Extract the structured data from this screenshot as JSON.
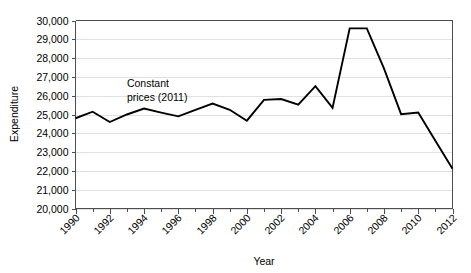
{
  "chart_data": {
    "type": "line",
    "title": "",
    "xlabel": "Year",
    "ylabel": "Expenditure",
    "x": [
      1990,
      1991,
      1992,
      1993,
      1994,
      1995,
      1996,
      1997,
      1998,
      1999,
      2000,
      2001,
      2002,
      2003,
      2004,
      2005,
      2006,
      2007,
      2008,
      2009,
      2010,
      2011,
      2012
    ],
    "values": [
      24800,
      25150,
      24600,
      25000,
      25320,
      25100,
      24900,
      25250,
      25580,
      25250,
      24670,
      25780,
      25820,
      25530,
      26510,
      25350,
      29580,
      29580,
      27450,
      25020,
      25100,
      23600,
      22120
    ],
    "series": [
      {
        "name": "Expenditure (constant prices, 2011)",
        "values": [
          24800,
          25150,
          24600,
          25000,
          25320,
          25100,
          24900,
          25250,
          25580,
          25250,
          24670,
          25780,
          25820,
          25530,
          26510,
          25350,
          29580,
          29580,
          27450,
          25020,
          25100,
          23600,
          22120
        ]
      }
    ],
    "xlim": [
      1990,
      2012
    ],
    "ylim": [
      20000,
      30000
    ],
    "ytick_values": [
      20000,
      21000,
      22000,
      23000,
      24000,
      25000,
      26000,
      27000,
      28000,
      29000,
      30000
    ],
    "ytick_labels": [
      "20,000",
      "21,000",
      "22,000",
      "23,000",
      "24,000",
      "25,000",
      "26,000",
      "27,000",
      "28,000",
      "29,000",
      "30,000"
    ],
    "xtick_values": [
      1990,
      1992,
      1994,
      1996,
      1998,
      2000,
      2002,
      2004,
      2006,
      2008,
      2010,
      2012
    ],
    "xtick_labels": [
      "1990",
      "1992",
      "1994",
      "1996",
      "1998",
      "2000",
      "2002",
      "2004",
      "2006",
      "2008",
      "2010",
      "2012"
    ],
    "xtick_minor_values": [
      1991,
      1993,
      1995,
      1997,
      1999,
      2001,
      2003,
      2005,
      2007,
      2009,
      2011
    ],
    "grid": true,
    "grid_axis": "y",
    "legend": false,
    "legend_position": "none",
    "line_color": "#000000",
    "grid_color": "#d9d9d9",
    "axis_color": "#4d4d4d",
    "background_color": "#ffffff",
    "annotations": [
      {
        "name": "constant-prices-note",
        "line1": "Constant",
        "line2": "prices (2011)",
        "x": 1993.0,
        "y": 26450
      }
    ]
  }
}
